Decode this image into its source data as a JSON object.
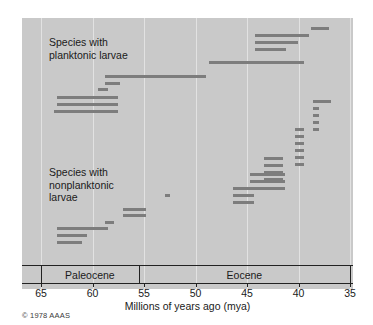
{
  "figure": {
    "credit": "© 1978 AAAS",
    "panel_bg": "#c9c9c9",
    "bar_color": "#7d7d7d",
    "grid_color": "#e2e2e2"
  },
  "axis": {
    "xlabel": "Millions of years ago (mya)",
    "ticks": [
      65,
      60,
      55,
      50,
      45,
      40,
      35
    ],
    "tick_labels": [
      "65",
      "60",
      "55",
      "50",
      "45",
      "40",
      "35"
    ],
    "min": 65,
    "max": 35,
    "direction": "decreasing"
  },
  "epochs": [
    {
      "name": "Paleocene",
      "start": 65,
      "end": 55.5
    },
    {
      "name": "Eocene",
      "start": 55.5,
      "end": 35
    }
  ],
  "groups": [
    {
      "id": "planktonic",
      "label": "Species with\nplanktonic larvae"
    },
    {
      "id": "nonplanktonic",
      "label": "Species with\nnonplanktonic\nlarvae"
    }
  ],
  "chart_data": {
    "type": "bar",
    "subtype": "horizontal-range-bars",
    "title": "",
    "xlabel": "Millions of years ago (mya)",
    "ylabel": "",
    "xlim": [
      65,
      35
    ],
    "xticks": [
      65,
      60,
      55,
      50,
      45,
      40,
      35
    ],
    "grid": true,
    "legend": "none",
    "annotations": [
      "Species with planktonic larvae",
      "Species with nonplanktonic larvae"
    ],
    "epoch_bands": [
      {
        "name": "Paleocene",
        "start": 65,
        "end": 55.5
      },
      {
        "name": "Eocene",
        "start": 55.5,
        "end": 35
      }
    ],
    "series": [
      {
        "name": "Species with planktonic larvae",
        "unit": "mya",
        "note": "Each bar is one species stratigraphic range (first to last appearance).",
        "ranges": [
          {
            "row": 1,
            "start": 38.8,
            "end": 37.0
          },
          {
            "row": 2,
            "start": 44.2,
            "end": 39.0
          },
          {
            "row": 3,
            "start": 44.2,
            "end": 40.0
          },
          {
            "row": 4,
            "start": 44.2,
            "end": 41.2
          },
          {
            "row": 5,
            "start": 48.7,
            "end": 39.5
          },
          {
            "row": 6,
            "start": 58.8,
            "end": 49.0
          },
          {
            "row": 7,
            "start": 58.8,
            "end": 57.3
          },
          {
            "row": 8,
            "start": 59.5,
            "end": 58.5
          },
          {
            "row": 9,
            "start": 63.5,
            "end": 57.5
          },
          {
            "row": 10,
            "start": 63.5,
            "end": 57.5
          },
          {
            "row": 11,
            "start": 63.7,
            "end": 57.5
          }
        ]
      },
      {
        "name": "Species with nonplanktonic larvae",
        "unit": "mya",
        "note": "Each bar is one species stratigraphic range (first to last appearance).",
        "ranges": [
          {
            "row": 1,
            "start": 38.6,
            "end": 36.8
          },
          {
            "row": 2,
            "start": 38.6,
            "end": 38.0
          },
          {
            "row": 3,
            "start": 38.6,
            "end": 38.0
          },
          {
            "row": 4,
            "start": 38.6,
            "end": 38.0
          },
          {
            "row": 5,
            "start": 38.6,
            "end": 38.0
          },
          {
            "row": 6,
            "start": 40.3,
            "end": 39.5
          },
          {
            "row": 7,
            "start": 40.3,
            "end": 39.5
          },
          {
            "row": 8,
            "start": 40.3,
            "end": 39.5
          },
          {
            "row": 9,
            "start": 40.3,
            "end": 39.5
          },
          {
            "row": 10,
            "start": 40.3,
            "end": 39.5
          },
          {
            "row": 11,
            "start": 40.3,
            "end": 39.5
          },
          {
            "row": 12,
            "start": 43.4,
            "end": 41.5
          },
          {
            "row": 13,
            "start": 43.4,
            "end": 41.5
          },
          {
            "row": 14,
            "start": 43.4,
            "end": 41.5
          },
          {
            "row": 15,
            "start": 43.4,
            "end": 41.5
          },
          {
            "row": 16,
            "start": 44.7,
            "end": 41.3
          },
          {
            "row": 17,
            "start": 44.7,
            "end": 41.3
          },
          {
            "row": 18,
            "start": 46.4,
            "end": 41.3
          },
          {
            "row": 19,
            "start": 46.4,
            "end": 44.3
          },
          {
            "row": 20,
            "start": 46.4,
            "end": 44.3
          },
          {
            "row": 21,
            "start": 53.0,
            "end": 52.5
          },
          {
            "row": 22,
            "start": 57.0,
            "end": 54.8
          },
          {
            "row": 23,
            "start": 57.0,
            "end": 54.8
          },
          {
            "row": 24,
            "start": 58.8,
            "end": 57.9
          },
          {
            "row": 25,
            "start": 63.5,
            "end": 58.5
          },
          {
            "row": 26,
            "start": 63.5,
            "end": 60.5
          },
          {
            "row": 27,
            "start": 63.5,
            "end": 61.0
          }
        ]
      }
    ]
  }
}
